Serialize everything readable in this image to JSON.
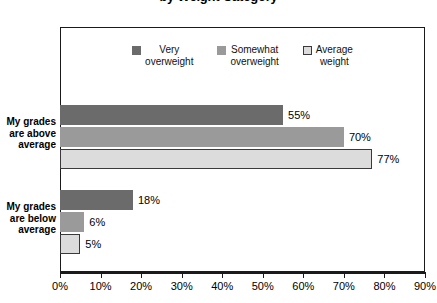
{
  "chart_data": {
    "type": "bar",
    "orientation": "horizontal",
    "title": "by Weight Category",
    "xlabel": "",
    "ylabel": "",
    "xlim": [
      0,
      90
    ],
    "xticks": [
      0,
      10,
      20,
      30,
      40,
      50,
      60,
      70,
      80,
      90
    ],
    "xtick_labels": [
      "0%",
      "10%",
      "20%",
      "30%",
      "40%",
      "50%",
      "60%",
      "70%",
      "80%",
      "90%"
    ],
    "grid": false,
    "legend_position": "top-center",
    "categories": [
      "My grades\nare above\naverage",
      "My grades\nare below\naverage"
    ],
    "series": [
      {
        "name": "Very\noverweight",
        "legend_label": "Very\noverweight",
        "color": "#6b6b6b",
        "outlined": false,
        "values": [
          55,
          18
        ],
        "value_labels": [
          "55%",
          "18%"
        ]
      },
      {
        "name": "Somewhat\noverweight",
        "legend_label": "Somewhat\noverweight",
        "color": "#9a9a9a",
        "outlined": false,
        "values": [
          70,
          6
        ],
        "value_labels": [
          "70%",
          "6%"
        ]
      },
      {
        "name": "Average\nweight",
        "legend_label": "Average\nweight",
        "color": "#dcdcdc",
        "outlined": true,
        "values": [
          77,
          5
        ],
        "value_labels": [
          "77%",
          "5%"
        ]
      }
    ]
  }
}
